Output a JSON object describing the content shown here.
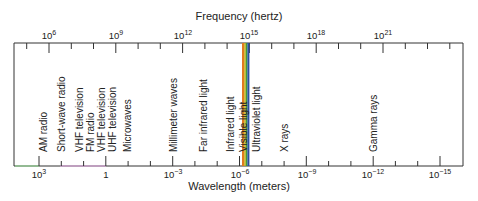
{
  "diagram": {
    "title_top": "Frequency (hertz)",
    "title_bottom": "Wavelength (meters)",
    "frequency_ticks": [
      {
        "base": "10",
        "exp": "6",
        "x": 49
      },
      {
        "base": "10",
        "exp": "9",
        "x": 116
      },
      {
        "base": "10",
        "exp": "12",
        "x": 183
      },
      {
        "base": "10",
        "exp": "15",
        "x": 249
      },
      {
        "base": "10",
        "exp": "18",
        "x": 316
      },
      {
        "base": "10",
        "exp": "21",
        "x": 383
      }
    ],
    "wavelength_ticks": [
      {
        "base": "10",
        "exp": "3",
        "x": 39
      },
      {
        "base": "1",
        "exp": "",
        "x": 106
      },
      {
        "base": "10",
        "exp": "−3",
        "x": 173
      },
      {
        "base": "10",
        "exp": "−6",
        "x": 240
      },
      {
        "base": "10",
        "exp": "−9",
        "x": 307
      },
      {
        "base": "10",
        "exp": "−12",
        "x": 373
      },
      {
        "base": "10",
        "exp": "−15",
        "x": 440
      }
    ],
    "regions": [
      {
        "label": "AM radio",
        "x": 47
      },
      {
        "label": "Short-wave radio",
        "x": 65
      },
      {
        "label": "VHF television",
        "x": 83
      },
      {
        "label": "FM radio",
        "x": 94
      },
      {
        "label": "VHF television",
        "x": 105
      },
      {
        "label": "UHF television",
        "x": 116
      },
      {
        "label": "Microwaves",
        "x": 131
      },
      {
        "label": "Millimeter waves",
        "x": 177
      },
      {
        "label": "Far infrared light",
        "x": 207
      },
      {
        "label": "Infrared light",
        "x": 234
      },
      {
        "label": "Visible light",
        "x": 247
      },
      {
        "label": "Ultraviolet light",
        "x": 260
      },
      {
        "label": "X rays",
        "x": 288
      },
      {
        "label": "Gamma rays",
        "x": 377
      }
    ],
    "colors": {
      "axis": "#333333",
      "visible_orange": "#e07a20",
      "visible_yellow": "#c9b21c",
      "visible_green": "#3f9a3a",
      "visible_blue": "#2a4fa0",
      "radio_green": "#8fd08f",
      "radio_pink": "#e3a6e3"
    }
  }
}
